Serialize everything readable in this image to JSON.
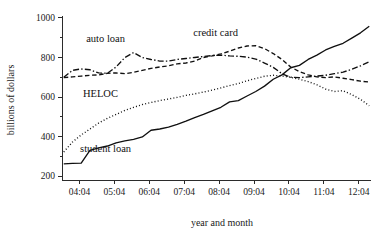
{
  "chart_data": {
    "type": "line",
    "title": "",
    "xlabel": "year and month",
    "ylabel": "billions of dollars",
    "grid": false,
    "legend_position": "inline-annotations",
    "xlim": [
      2003.75,
      2012.6
    ],
    "ylim": [
      180,
      1010
    ],
    "yticks": [
      200,
      400,
      600,
      800,
      1000
    ],
    "ytick_labels": [
      "200",
      "400",
      "600",
      "800",
      "1000"
    ],
    "yminor_ticks": [
      300,
      500,
      700,
      900
    ],
    "xticks": [
      2004.25,
      2005.25,
      2006.25,
      2007.25,
      2008.25,
      2009.25,
      2010.25,
      2011.25,
      2012.25
    ],
    "xtick_labels": [
      "04:04",
      "05:04",
      "06:04",
      "07:04",
      "08:04",
      "09:04",
      "10:04",
      "11:04",
      "12:04"
    ],
    "x": [
      2003.8,
      2004.05,
      2004.3,
      2004.55,
      2004.8,
      2005.05,
      2005.3,
      2005.55,
      2005.8,
      2006.05,
      2006.3,
      2006.55,
      2006.8,
      2007.05,
      2007.3,
      2007.55,
      2007.8,
      2008.05,
      2008.3,
      2008.55,
      2008.8,
      2009.05,
      2009.3,
      2009.55,
      2009.8,
      2010.05,
      2010.3,
      2010.55,
      2010.8,
      2011.05,
      2011.3,
      2011.55,
      2011.8,
      2012.05,
      2012.3,
      2012.55
    ],
    "series": [
      {
        "name": "student loan",
        "style": "solid",
        "label": "student loan",
        "label_x": 2005.0,
        "label_y": 320,
        "values": [
          262,
          264,
          265,
          330,
          343,
          352,
          368,
          378,
          386,
          398,
          432,
          438,
          448,
          462,
          478,
          496,
          512,
          530,
          548,
          575,
          582,
          605,
          628,
          655,
          690,
          712,
          748,
          760,
          790,
          812,
          838,
          856,
          872,
          898,
          925,
          958
        ]
      },
      {
        "name": "HELOC",
        "style": "dotted",
        "label": "HELOC",
        "label_x": 2004.85,
        "label_y": 600,
        "values": [
          322,
          372,
          408,
          438,
          468,
          492,
          512,
          532,
          548,
          562,
          572,
          582,
          590,
          598,
          608,
          616,
          625,
          635,
          646,
          658,
          668,
          682,
          694,
          705,
          710,
          706,
          700,
          690,
          678,
          662,
          640,
          628,
          632,
          612,
          588,
          556
        ]
      },
      {
        "name": "auto loan",
        "style": "dashdot",
        "label": "auto loan",
        "label_x": 2005.0,
        "label_y": 880,
        "values": [
          700,
          735,
          742,
          738,
          722,
          720,
          752,
          800,
          825,
          800,
          790,
          782,
          782,
          790,
          795,
          800,
          805,
          810,
          812,
          808,
          806,
          802,
          792,
          772,
          750,
          718,
          700,
          698,
          702,
          706,
          710,
          718,
          726,
          740,
          758,
          778
        ]
      },
      {
        "name": "credit card",
        "style": "dashed",
        "label": "credit card",
        "label_x": 2008.15,
        "label_y": 908,
        "values": [
          698,
          702,
          706,
          710,
          712,
          720,
          722,
          718,
          725,
          735,
          745,
          752,
          758,
          768,
          772,
          782,
          800,
          808,
          818,
          832,
          848,
          858,
          860,
          845,
          820,
          790,
          752,
          728,
          712,
          702,
          698,
          702,
          695,
          688,
          680,
          676
        ]
      }
    ]
  },
  "axes": {
    "y_axis_title": "billions of dollars",
    "x_axis_title": "year and month"
  }
}
